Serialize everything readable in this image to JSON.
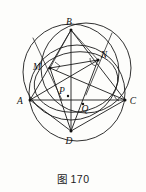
{
  "figure": {
    "caption": "图 170",
    "caption_number": "170",
    "caption_prefix": "图",
    "type": "euclidean-geometry-diagram",
    "background_color": "#fdfdfb",
    "ink_color": "#1a1a1a"
  },
  "points": [
    {
      "id": "A",
      "label": "A",
      "x": 30,
      "y": 100,
      "label_dx": -10,
      "label_dy": 4,
      "dot": true
    },
    {
      "id": "B",
      "label": "B",
      "x": 71,
      "y": 30,
      "label_dx": -2,
      "label_dy": -5,
      "dot": true
    },
    {
      "id": "C",
      "label": "C",
      "x": 125,
      "y": 100,
      "label_dx": 5,
      "label_dy": 4,
      "dot": true
    },
    {
      "id": "D",
      "label": "D",
      "x": 71,
      "y": 131,
      "label_dx": -2,
      "label_dy": 13,
      "dot": true
    },
    {
      "id": "M",
      "label": "M",
      "x": 50,
      "y": 68,
      "label_dx": -13,
      "label_dy": 2,
      "dot": true
    },
    {
      "id": "N",
      "label": "N",
      "x": 98,
      "y": 60,
      "label_dx": 4,
      "label_dy": -2,
      "dot": true
    },
    {
      "id": "P",
      "label": "P",
      "x": 68,
      "y": 96,
      "label_dx": -8,
      "label_dy": -2,
      "dot": true
    },
    {
      "id": "Q",
      "label": "Q",
      "x": 83,
      "y": 104,
      "label_dx": 1,
      "label_dy": 8,
      "dot": true
    }
  ],
  "circles": [
    {
      "id": "circumcircle-ABC",
      "cx": 71,
      "cy": 72,
      "r": 48,
      "name": "upper-left-circle"
    },
    {
      "id": "circle-BNC",
      "cx": 86,
      "cy": 68,
      "r": 45,
      "name": "upper-right-circle"
    },
    {
      "id": "circle-ADC",
      "cx": 77,
      "cy": 93,
      "r": 48,
      "name": "lower-circle"
    }
  ],
  "conics": [
    {
      "id": "inner-ellipse",
      "cx": 76,
      "cy": 82,
      "rx": 42,
      "ry": 30,
      "rot": -8,
      "name": "inner-conic-through-M-N-D"
    }
  ],
  "segments": [
    {
      "from": "A",
      "to": "B",
      "name": "side-AB"
    },
    {
      "from": "B",
      "to": "C",
      "name": "side-BC"
    },
    {
      "from": "A",
      "to": "C",
      "name": "side-AC"
    },
    {
      "from": "B",
      "to": "D",
      "name": "cevian-BD"
    },
    {
      "from": "A",
      "to": "D",
      "name": "segment-AD"
    },
    {
      "from": "C",
      "to": "D",
      "name": "segment-CD"
    },
    {
      "from": "M",
      "to": "N",
      "name": "segment-MN"
    },
    {
      "from": "M",
      "to": "C",
      "name": "segment-MC"
    },
    {
      "from": "A",
      "to": "N",
      "name": "segment-AN"
    },
    {
      "from": "M",
      "to": "D",
      "name": "segment-MD"
    },
    {
      "from": "N",
      "to": "D",
      "name": "segment-ND"
    },
    {
      "from": "B",
      "to": "M",
      "name": "segment-BM"
    },
    {
      "from": "B",
      "to": "N",
      "name": "segment-BN"
    }
  ],
  "rays": [
    {
      "id": "ray-through-M",
      "x1": 33,
      "y1": 38,
      "x2": 62,
      "y2": 100,
      "name": "ray-through-M"
    },
    {
      "id": "ray-through-N",
      "x1": 112,
      "y1": 33,
      "x2": 86,
      "y2": 95,
      "name": "ray-through-N"
    }
  ],
  "angle_marks": [
    {
      "at": "M",
      "name": "right-angle-mark-at-M"
    },
    {
      "at": "N",
      "name": "angle-mark-at-N"
    },
    {
      "at": "C",
      "name": "angle-mark-at-C"
    }
  ]
}
